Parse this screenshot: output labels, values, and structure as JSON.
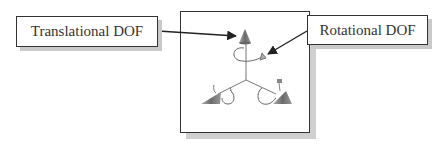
{
  "labels": {
    "translational": "Translational DOF",
    "rotational": "Rotational DOF"
  },
  "figure": {
    "colors": {
      "cone": "#7a7a7a",
      "line": "#555555",
      "border": "#333333",
      "shadow": "#c9c9c9"
    }
  }
}
